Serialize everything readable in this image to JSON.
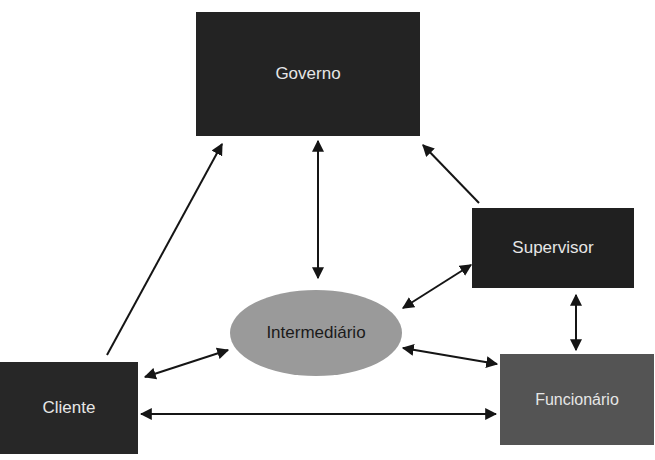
{
  "diagram": {
    "type": "relationship-diagram",
    "nodes": [
      {
        "id": "governo",
        "label": "Governo",
        "shape": "rectangle",
        "fill": "#232323",
        "text_color": "#e6e6e6"
      },
      {
        "id": "supervisor",
        "label": "Supervisor",
        "shape": "rectangle",
        "fill": "#202020",
        "text_color": "#e6e6e6"
      },
      {
        "id": "intermediario",
        "label": "Intermediário",
        "shape": "ellipse",
        "fill": "#9a9a9a",
        "text_color": "#1a1a1a"
      },
      {
        "id": "cliente",
        "label": "Cliente",
        "shape": "rectangle",
        "fill": "#272727",
        "text_color": "#e6e6e6"
      },
      {
        "id": "funcionario",
        "label": "Funcionário",
        "shape": "rectangle",
        "fill": "#545454",
        "text_color": "#e6e6e6"
      }
    ],
    "edges": [
      {
        "from": "cliente",
        "to": "governo",
        "direction": "one-way"
      },
      {
        "from": "supervisor",
        "to": "governo",
        "direction": "one-way"
      },
      {
        "from": "governo",
        "to": "intermediario",
        "direction": "two-way"
      },
      {
        "from": "intermediario",
        "to": "supervisor",
        "direction": "two-way"
      },
      {
        "from": "supervisor",
        "to": "funcionario",
        "direction": "two-way"
      },
      {
        "from": "intermediario",
        "to": "funcionario",
        "direction": "two-way"
      },
      {
        "from": "cliente",
        "to": "intermediario",
        "direction": "two-way"
      },
      {
        "from": "cliente",
        "to": "funcionario",
        "direction": "two-way"
      }
    ]
  },
  "labels": {
    "governo": "Governo",
    "supervisor": "Supervisor",
    "intermediario": "Intermediário",
    "cliente": "Cliente",
    "funcionario": "Funcionário"
  }
}
